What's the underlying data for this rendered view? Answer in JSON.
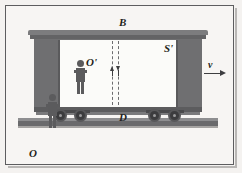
{
  "figure": {
    "width": 242,
    "height": 173,
    "background_color": "#f4f2f0",
    "frame_color": "#5d5d5f"
  },
  "labels": {
    "top_point": "B",
    "frame_moving": "S'",
    "observer_inside": "O'",
    "bottom_point": "D",
    "observer_outside": "O",
    "velocity": "v"
  },
  "objects": {
    "boxcar": {
      "name": "boxcar",
      "body_color": "#6f6f71",
      "interior_color": "#fbfbf9",
      "roof_color": "#7c7c7e"
    },
    "ground_rail": {
      "name": "ground-rail",
      "color": "#737375"
    },
    "wheels": {
      "count": 4,
      "color": "#3c3c3e"
    },
    "observer_inside_figure": {
      "name": "observer-inside",
      "color": "#5b5b5d"
    },
    "observer_outside_figure": {
      "name": "observer-outside",
      "color": "#5b5b5d"
    },
    "light_path": {
      "name": "vertical-dashed-light-path",
      "style": "dashed",
      "color": "#6d6d6f",
      "arrow_direction": "bidirectional-vertical"
    },
    "velocity_vector": {
      "name": "velocity-vector",
      "direction": "right",
      "color": "#3e3e40"
    }
  }
}
